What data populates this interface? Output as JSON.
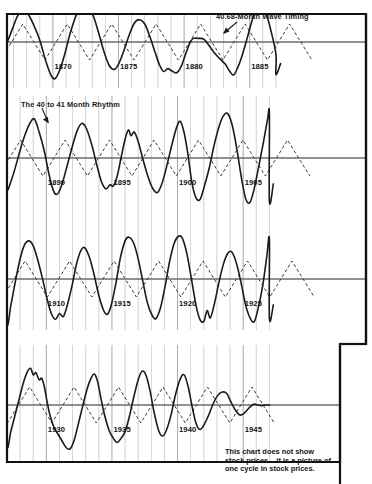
{
  "figure": {
    "title": "",
    "annotations": {
      "wave_timing": "40.68-Month Wave Timing",
      "rhythm": "The 40 to 41 Month Rhythm"
    },
    "caption": "This chart does not show stock prices – it is a picture of one cycle in stock prices.",
    "colors": {
      "ink": "#1a1a1a",
      "grid": "#9a9aa0",
      "zero_line": "#6b6b72",
      "border": "#111111",
      "background": "#ffffff"
    }
  },
  "chart_data": {
    "type": "line",
    "xlabel": "",
    "ylabel": "",
    "grid": true,
    "legend_position": "inline-annotation",
    "xlim": [
      1866.5,
      1947.0
    ],
    "ylim": [
      -1.25,
      1.25
    ],
    "x_tick_step": 1,
    "x_major_tick_step": 5,
    "bands": [
      {
        "name": "band-1",
        "x_start": 1866.5,
        "x_end": 1887.0,
        "year_labels": [
          "1870",
          "1875",
          "1880",
          "1885"
        ],
        "year_label_values": [
          1870,
          1875,
          1880,
          1885
        ]
      },
      {
        "name": "band-2",
        "x_start": 1887.0,
        "x_end": 1907.0,
        "year_labels": [
          "1890",
          "1895",
          "1900",
          "1905"
        ],
        "year_label_values": [
          1890,
          1895,
          1900,
          1905
        ]
      },
      {
        "name": "band-3",
        "x_start": 1907.0,
        "x_end": 1927.0,
        "year_labels": [
          "1910",
          "1915",
          "1920",
          "1925"
        ],
        "year_label_values": [
          1910,
          1915,
          1920,
          1925
        ]
      },
      {
        "name": "band-4",
        "x_start": 1927.0,
        "x_end": 1947.0,
        "year_labels": [
          "1930",
          "1935",
          "1940",
          "1945"
        ],
        "year_label_values": [
          1930,
          1935,
          1940,
          1945
        ]
      }
    ],
    "series": [
      {
        "name": "The 40 to 41 Month Rhythm",
        "style": "solid",
        "color": "#1a1a1a",
        "width": 1.6,
        "description": "Irregular observed cyclical wave in stock prices",
        "points": [
          [
            1866.5,
            -0.02
          ],
          [
            1866.9,
            0.35
          ],
          [
            1867.3,
            0.72
          ],
          [
            1867.7,
            0.86
          ],
          [
            1868.1,
            0.78
          ],
          [
            1868.55,
            0.46
          ],
          [
            1869.0,
            0.05
          ],
          [
            1869.45,
            -0.52
          ],
          [
            1869.85,
            -0.92
          ],
          [
            1870.15,
            -1.02
          ],
          [
            1870.5,
            -0.8
          ],
          [
            1870.9,
            -0.34
          ],
          [
            1871.3,
            0.22
          ],
          [
            1871.75,
            0.72
          ],
          [
            1872.15,
            0.95
          ],
          [
            1872.55,
            1.02
          ],
          [
            1873.0,
            0.8
          ],
          [
            1873.45,
            0.3
          ],
          [
            1873.9,
            -0.28
          ],
          [
            1874.3,
            -0.66
          ],
          [
            1874.7,
            -0.76
          ],
          [
            1875.05,
            -0.58
          ],
          [
            1875.4,
            -0.25
          ],
          [
            1875.8,
            0.18
          ],
          [
            1876.2,
            0.52
          ],
          [
            1876.6,
            0.62
          ],
          [
            1877.0,
            0.5
          ],
          [
            1877.4,
            0.14
          ],
          [
            1877.8,
            -0.3
          ],
          [
            1878.15,
            -0.66
          ],
          [
            1878.45,
            -0.82
          ],
          [
            1878.75,
            -0.74
          ],
          [
            1879.05,
            -0.8
          ],
          [
            1879.4,
            -0.86
          ],
          [
            1879.75,
            -0.7
          ],
          [
            1880.1,
            -0.35
          ],
          [
            1880.45,
            -0.02
          ],
          [
            1880.7,
            0.1
          ],
          [
            1881.1,
            0.1
          ],
          [
            1881.5,
            0.08
          ],
          [
            1881.9,
            -0.1
          ],
          [
            1882.3,
            -0.3
          ],
          [
            1882.7,
            -0.46
          ],
          [
            1883.1,
            -0.6
          ],
          [
            1883.45,
            -0.8
          ],
          [
            1883.75,
            -0.92
          ],
          [
            1884.05,
            -0.74
          ],
          [
            1884.4,
            -0.4
          ],
          [
            1884.8,
            0.1
          ],
          [
            1885.2,
            0.62
          ],
          [
            1885.55,
            0.94
          ],
          [
            1885.85,
            1.1
          ],
          [
            1886.2,
            0.86
          ],
          [
            1886.6,
            0.34
          ],
          [
            1887.0,
            -0.35
          ],
          [
            1887.0,
            -0.9
          ],
          [
            1887.35,
            -0.6
          ],
          [
            1887.7,
            -0.18
          ],
          [
            1888.05,
            0.28
          ],
          [
            1888.45,
            0.72
          ],
          [
            1888.8,
            1.0
          ],
          [
            1889.1,
            1.08
          ],
          [
            1889.45,
            0.72
          ],
          [
            1889.85,
            0.18
          ],
          [
            1890.2,
            -0.45
          ],
          [
            1890.55,
            -0.92
          ],
          [
            1890.85,
            -1.0
          ],
          [
            1891.2,
            -0.72
          ],
          [
            1891.55,
            -0.26
          ],
          [
            1891.95,
            0.28
          ],
          [
            1892.35,
            0.76
          ],
          [
            1892.7,
            0.96
          ],
          [
            1893.05,
            0.82
          ],
          [
            1893.45,
            0.38
          ],
          [
            1893.85,
            -0.2
          ],
          [
            1894.2,
            -0.66
          ],
          [
            1894.55,
            -0.86
          ],
          [
            1894.85,
            -0.74
          ],
          [
            1895.1,
            -0.78
          ],
          [
            1895.4,
            -0.5
          ],
          [
            1895.7,
            0.02
          ],
          [
            1896.0,
            0.52
          ],
          [
            1896.25,
            0.78
          ],
          [
            1896.45,
            0.62
          ],
          [
            1896.7,
            0.72
          ],
          [
            1897.0,
            0.46
          ],
          [
            1897.35,
            -0.02
          ],
          [
            1897.75,
            -0.52
          ],
          [
            1898.1,
            -0.84
          ],
          [
            1898.45,
            -0.96
          ],
          [
            1898.8,
            -0.72
          ],
          [
            1899.15,
            -0.26
          ],
          [
            1899.55,
            0.34
          ],
          [
            1899.9,
            0.82
          ],
          [
            1900.2,
            1.02
          ],
          [
            1900.5,
            0.7
          ],
          [
            1900.8,
            0.08
          ],
          [
            1901.1,
            -0.7
          ],
          [
            1901.4,
            -1.1
          ],
          [
            1901.7,
            -1.16
          ],
          [
            1902.0,
            -0.84
          ],
          [
            1902.4,
            -0.3
          ],
          [
            1902.8,
            0.38
          ],
          [
            1903.2,
            0.92
          ],
          [
            1903.55,
            1.2
          ],
          [
            1903.85,
            1.22
          ],
          [
            1904.2,
            0.86
          ],
          [
            1904.55,
            0.18
          ],
          [
            1904.9,
            -0.62
          ],
          [
            1905.2,
            -1.14
          ],
          [
            1905.5,
            -1.24
          ],
          [
            1905.8,
            -0.92
          ],
          [
            1906.15,
            -0.3
          ],
          [
            1906.55,
            0.45
          ],
          [
            1906.85,
            1.05
          ],
          [
            1907.0,
            1.22
          ],
          [
            1907.0,
            -1.2
          ],
          [
            1907.3,
            -0.72
          ],
          [
            1907.6,
            -0.14
          ],
          [
            1907.95,
            0.48
          ],
          [
            1908.3,
            0.92
          ],
          [
            1908.65,
            1.06
          ],
          [
            1909.0,
            0.92
          ],
          [
            1909.35,
            0.52
          ],
          [
            1909.75,
            -0.06
          ],
          [
            1910.1,
            -0.62
          ],
          [
            1910.4,
            -0.98
          ],
          [
            1910.7,
            -1.12
          ],
          [
            1911.0,
            -0.96
          ],
          [
            1911.3,
            -1.04
          ],
          [
            1911.6,
            -0.72
          ],
          [
            1911.95,
            -0.2
          ],
          [
            1912.3,
            0.42
          ],
          [
            1912.65,
            0.8
          ],
          [
            1912.95,
            0.86
          ],
          [
            1913.3,
            0.58
          ],
          [
            1913.65,
            0.1
          ],
          [
            1914.0,
            -0.46
          ],
          [
            1914.35,
            -0.86
          ],
          [
            1914.65,
            -0.98
          ],
          [
            1914.95,
            -0.72
          ],
          [
            1915.3,
            -0.12
          ],
          [
            1915.65,
            0.6
          ],
          [
            1916.0,
            1.06
          ],
          [
            1916.3,
            1.16
          ],
          [
            1916.65,
            1.0
          ],
          [
            1917.0,
            0.56
          ],
          [
            1917.35,
            -0.06
          ],
          [
            1917.7,
            -0.66
          ],
          [
            1918.05,
            -1.0
          ],
          [
            1918.35,
            -1.1
          ],
          [
            1918.7,
            -0.8
          ],
          [
            1919.05,
            -0.2
          ],
          [
            1919.4,
            0.5
          ],
          [
            1919.75,
            1.0
          ],
          [
            1920.05,
            1.18
          ],
          [
            1920.35,
            1.14
          ],
          [
            1920.7,
            0.72
          ],
          [
            1921.05,
            0.02
          ],
          [
            1921.4,
            -0.72
          ],
          [
            1921.7,
            -1.12
          ],
          [
            1922.0,
            -1.18
          ],
          [
            1922.25,
            -0.88
          ],
          [
            1922.5,
            -1.08
          ],
          [
            1922.8,
            -0.7
          ],
          [
            1923.15,
            -0.1
          ],
          [
            1923.5,
            0.42
          ],
          [
            1923.85,
            0.72
          ],
          [
            1924.15,
            0.74
          ],
          [
            1924.5,
            0.42
          ],
          [
            1924.85,
            -0.12
          ],
          [
            1925.2,
            -0.74
          ],
          [
            1925.55,
            -1.1
          ],
          [
            1925.85,
            -1.18
          ],
          [
            1926.15,
            -0.8
          ],
          [
            1926.5,
            -0.16
          ],
          [
            1926.8,
            0.62
          ],
          [
            1927.0,
            1.1
          ],
          [
            1927.0,
            -1.1
          ],
          [
            1927.3,
            -0.72
          ],
          [
            1927.6,
            -0.3
          ],
          [
            1927.95,
            0.2
          ],
          [
            1928.25,
            0.62
          ],
          [
            1928.55,
            0.92
          ],
          [
            1928.8,
            1.02
          ],
          [
            1929.0,
            0.84
          ],
          [
            1929.2,
            0.9
          ],
          [
            1929.45,
            0.7
          ],
          [
            1929.65,
            0.74
          ],
          [
            1929.85,
            0.5
          ],
          [
            1930.05,
            0.1
          ],
          [
            1930.3,
            -0.32
          ],
          [
            1930.6,
            -0.64
          ],
          [
            1930.9,
            -0.82
          ],
          [
            1931.2,
            -1.0
          ],
          [
            1931.5,
            -1.18
          ],
          [
            1931.8,
            -1.22
          ],
          [
            1932.1,
            -1.0
          ],
          [
            1932.4,
            -0.58
          ],
          [
            1932.75,
            -0.06
          ],
          [
            1933.1,
            0.44
          ],
          [
            1933.4,
            0.74
          ],
          [
            1933.65,
            0.86
          ],
          [
            1933.9,
            0.66
          ],
          [
            1934.15,
            0.2
          ],
          [
            1934.45,
            -0.3
          ],
          [
            1934.8,
            -0.72
          ],
          [
            1935.1,
            -0.92
          ],
          [
            1935.4,
            -1.04
          ],
          [
            1935.7,
            -0.92
          ],
          [
            1936.0,
            -0.74
          ],
          [
            1936.3,
            -0.36
          ],
          [
            1936.65,
            0.2
          ],
          [
            1937.0,
            0.7
          ],
          [
            1937.3,
            0.94
          ],
          [
            1937.6,
            0.82
          ],
          [
            1937.9,
            0.4
          ],
          [
            1938.2,
            -0.18
          ],
          [
            1938.55,
            -0.7
          ],
          [
            1938.85,
            -0.86
          ],
          [
            1939.15,
            -0.7
          ],
          [
            1939.5,
            -0.28
          ],
          [
            1939.85,
            0.3
          ],
          [
            1940.2,
            0.72
          ],
          [
            1940.5,
            0.84
          ],
          [
            1940.8,
            0.52
          ],
          [
            1941.1,
            -0.02
          ],
          [
            1941.4,
            -0.5
          ],
          [
            1941.7,
            -0.68
          ],
          [
            1942.0,
            -0.56
          ],
          [
            1942.35,
            -0.3
          ],
          [
            1942.7,
            0.02
          ],
          [
            1943.05,
            0.26
          ],
          [
            1943.4,
            0.36
          ],
          [
            1943.75,
            0.32
          ],
          [
            1944.05,
            0.1
          ],
          [
            1944.4,
            -0.14
          ],
          [
            1944.75,
            -0.28
          ],
          [
            1945.1,
            -0.22
          ],
          [
            1945.45,
            -0.08
          ],
          [
            1945.8,
            0.02
          ],
          [
            1946.1,
            0.0
          ],
          [
            1946.4,
            -0.02
          ],
          [
            1946.7,
            0.0
          ],
          [
            1947.0,
            0.0
          ]
        ]
      },
      {
        "name": "40.68-Month Wave Timing",
        "style": "dashed",
        "color": "#3a3a42",
        "width": 1.0,
        "description": "Idealized regular 40.68-month (3.39 year) triangular wave",
        "period_months": 40.68,
        "period_years": 3.39,
        "amplitude": 0.5,
        "peak_years": [
          1867.7,
          1871.09,
          1874.48,
          1877.87,
          1881.26,
          1884.65,
          1888.04,
          1891.43,
          1894.82,
          1898.21,
          1901.6,
          1904.99,
          1908.38,
          1911.77,
          1915.16,
          1918.55,
          1921.94,
          1925.33,
          1928.72,
          1932.11,
          1935.5,
          1938.89,
          1942.28,
          1945.67
        ],
        "trough_years": [
          1869.4,
          1872.79,
          1876.18,
          1879.57,
          1882.96,
          1886.35,
          1889.74,
          1893.13,
          1896.52,
          1899.91,
          1903.3,
          1906.69,
          1910.08,
          1913.47,
          1916.86,
          1920.25,
          1923.64,
          1927.03,
          1930.42,
          1933.81,
          1937.2,
          1940.59,
          1943.98
        ]
      }
    ]
  }
}
